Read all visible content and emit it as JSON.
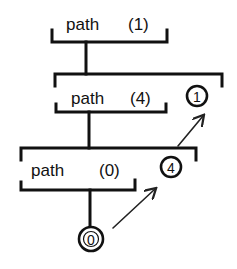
{
  "diagram": {
    "nodes": [
      {
        "id": "path-1",
        "label": "path",
        "arg": "(1)"
      },
      {
        "id": "path-4",
        "label": "path",
        "arg": "(4)",
        "value": "1"
      },
      {
        "id": "path-0",
        "label": "path",
        "arg": "(0)",
        "value": "4"
      },
      {
        "id": "leaf",
        "value": "0"
      }
    ],
    "edges": [
      {
        "from": "path-1",
        "to": "path-4",
        "type": "call"
      },
      {
        "from": "path-4",
        "to": "path-0",
        "type": "call"
      },
      {
        "from": "path-0",
        "to": "leaf",
        "type": "call"
      },
      {
        "from": "leaf",
        "to": "path-0",
        "type": "return"
      },
      {
        "from": "path-0",
        "to": "path-4",
        "type": "return"
      }
    ]
  }
}
